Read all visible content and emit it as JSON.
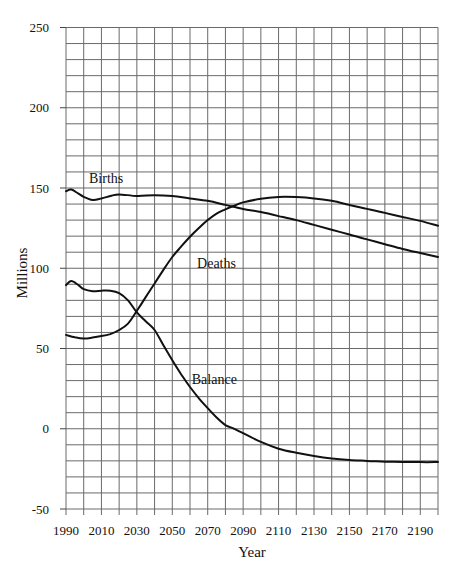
{
  "chart_data": {
    "type": "line",
    "title": "",
    "xlabel": "Year",
    "ylabel": "Millions",
    "xlim": [
      1990,
      2200
    ],
    "ylim": [
      -50,
      250
    ],
    "grid": true,
    "x_grid_step": 10,
    "y_grid_step": 10,
    "x_ticks": [
      1990,
      2010,
      2030,
      2050,
      2070,
      2090,
      2110,
      2130,
      2150,
      2170,
      2190
    ],
    "y_ticks": [
      -50,
      0,
      50,
      100,
      150,
      200,
      250
    ],
    "legend": "inline labels",
    "series": [
      {
        "name": "Births",
        "label_pos": [
          2003,
          153
        ],
        "points": [
          [
            1990,
            148
          ],
          [
            1993,
            149
          ],
          [
            1997,
            146.5
          ],
          [
            2000,
            144.5
          ],
          [
            2005,
            142.5
          ],
          [
            2010,
            143.5
          ],
          [
            2015,
            145
          ],
          [
            2020,
            146
          ],
          [
            2030,
            145
          ],
          [
            2040,
            145.5
          ],
          [
            2050,
            145
          ],
          [
            2060,
            143.5
          ],
          [
            2070,
            142
          ],
          [
            2080,
            139.5
          ],
          [
            2090,
            137
          ],
          [
            2100,
            135
          ],
          [
            2110,
            132.5
          ],
          [
            2120,
            130
          ],
          [
            2130,
            127
          ],
          [
            2140,
            124
          ],
          [
            2150,
            121
          ],
          [
            2160,
            118
          ],
          [
            2170,
            115
          ],
          [
            2180,
            112
          ],
          [
            2190,
            109.5
          ],
          [
            2200,
            107
          ]
        ]
      },
      {
        "name": "Deaths",
        "label_pos": [
          2064,
          100
        ],
        "points": [
          [
            1990,
            58.5
          ],
          [
            1995,
            57
          ],
          [
            2000,
            56.2
          ],
          [
            2005,
            56.8
          ],
          [
            2010,
            57.7
          ],
          [
            2015,
            59
          ],
          [
            2020,
            61.5
          ],
          [
            2025,
            65.5
          ],
          [
            2030,
            73.5
          ],
          [
            2035,
            82
          ],
          [
            2040,
            90.5
          ],
          [
            2045,
            99
          ],
          [
            2050,
            107
          ],
          [
            2055,
            113.5
          ],
          [
            2060,
            119.6
          ],
          [
            2065,
            125
          ],
          [
            2070,
            130
          ],
          [
            2075,
            134
          ],
          [
            2080,
            136.7
          ],
          [
            2085,
            139
          ],
          [
            2090,
            141
          ],
          [
            2100,
            143.3
          ],
          [
            2110,
            144.4
          ],
          [
            2120,
            144.3
          ],
          [
            2130,
            143.5
          ],
          [
            2140,
            142
          ],
          [
            2150,
            139.5
          ],
          [
            2160,
            137
          ],
          [
            2170,
            134.5
          ],
          [
            2180,
            132
          ],
          [
            2190,
            129.5
          ],
          [
            2200,
            126.5
          ]
        ]
      },
      {
        "name": "Balance",
        "label_pos": [
          2061,
          28
        ],
        "points": [
          [
            1990,
            89.5
          ],
          [
            1993,
            92
          ],
          [
            1997,
            89.5
          ],
          [
            2000,
            87
          ],
          [
            2005,
            85.7
          ],
          [
            2010,
            86
          ],
          [
            2015,
            86
          ],
          [
            2020,
            84.5
          ],
          [
            2025,
            80
          ],
          [
            2030,
            72.5
          ],
          [
            2035,
            67
          ],
          [
            2040,
            61.5
          ],
          [
            2045,
            52
          ],
          [
            2050,
            42.7
          ],
          [
            2055,
            34
          ],
          [
            2060,
            26
          ],
          [
            2065,
            19
          ],
          [
            2070,
            12.8
          ],
          [
            2075,
            7
          ],
          [
            2080,
            2.3
          ],
          [
            2085,
            0
          ],
          [
            2090,
            -2.7
          ],
          [
            2095,
            -5.5
          ],
          [
            2100,
            -8.2
          ],
          [
            2110,
            -12.4
          ],
          [
            2120,
            -15
          ],
          [
            2130,
            -17
          ],
          [
            2140,
            -18.6
          ],
          [
            2150,
            -19.5
          ],
          [
            2160,
            -20
          ],
          [
            2170,
            -20.5
          ],
          [
            2180,
            -20.7
          ],
          [
            2190,
            -20.8
          ],
          [
            2200,
            -20.8
          ]
        ]
      }
    ]
  },
  "labels": {
    "xlabel": "Year",
    "ylabel": "Millions",
    "births": "Births",
    "deaths": "Deaths",
    "balance": "Balance"
  }
}
